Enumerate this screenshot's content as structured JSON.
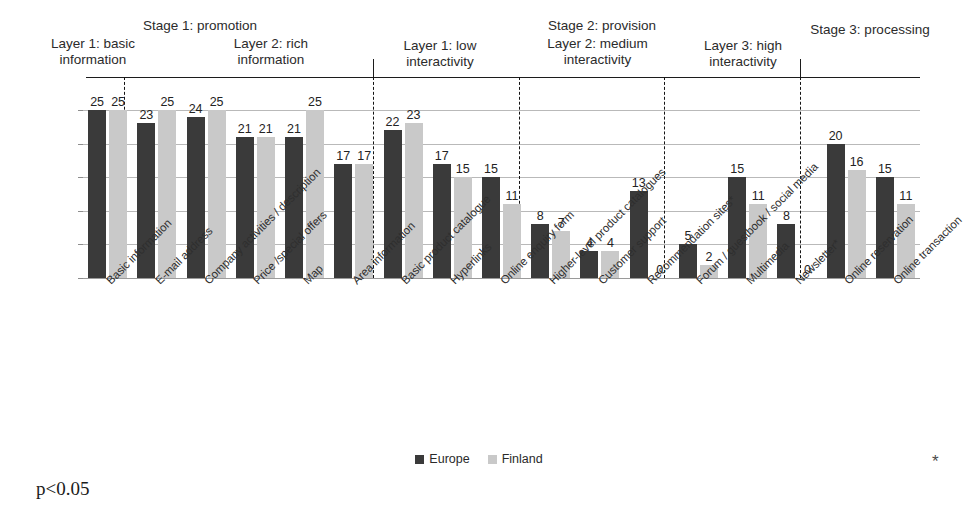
{
  "chart_data": {
    "type": "bar",
    "title": "",
    "xlabel": "",
    "ylabel": "",
    "ylim": [
      0,
      25
    ],
    "grid": true,
    "gridline_values": [
      25,
      20,
      15,
      10,
      5,
      0
    ],
    "legend_position": "bottom-center",
    "categories": [
      "Basic information",
      "E-mail address",
      "Company activities / description",
      "Price /special offers",
      "Map",
      "Area information",
      "Basic product catalogue",
      "Hyperlinks",
      "Online enquiry form",
      "Higher-level product catalogues",
      "Customer support",
      "Recommendation sites*",
      "Forum / guestbook / social media",
      "Multimedia",
      "Newsletter*",
      "Online reservation",
      "Online transaction"
    ],
    "series": [
      {
        "name": "Europe",
        "color": "#3a3a3a",
        "values": [
          25,
          23,
          24,
          21,
          21,
          17,
          22,
          17,
          15,
          8,
          4,
          13,
          5,
          15,
          8,
          20,
          15
        ]
      },
      {
        "name": "Finland",
        "color": "#c9c9c9",
        "values": [
          25,
          25,
          25,
          21,
          25,
          17,
          23,
          15,
          11,
          7,
          4,
          0,
          2,
          11,
          0,
          16,
          11
        ]
      }
    ],
    "annotations": [
      "p<0.05",
      "*"
    ]
  },
  "header": {
    "stage_labels": [
      {
        "text": "Stage 1: promotion",
        "left": 100,
        "top": 18,
        "width": 200
      },
      {
        "text": "Stage 2: provision",
        "left": 512,
        "top": 18,
        "width": 180
      },
      {
        "text": "Stage 3: processing",
        "left": 780,
        "top": 22,
        "width": 180
      }
    ],
    "layer_labels": [
      {
        "text": "Layer 1: basic\ninformation",
        "left": 28,
        "top": 36,
        "width": 130
      },
      {
        "text": "Layer 2: rich\ninformation",
        "left": 196,
        "top": 36,
        "width": 150
      },
      {
        "text": "Layer 1: low\ninteractivity",
        "left": 374,
        "top": 38,
        "width": 132
      },
      {
        "text": "Layer 2: medium\ninteractivity",
        "left": 515,
        "top": 36,
        "width": 165
      },
      {
        "text": "Layer 3: high\ninteractivity",
        "left": 673,
        "top": 38,
        "width": 140
      }
    ]
  },
  "plot": {
    "dividers_px": [
      124,
      373,
      519,
      664,
      800
    ],
    "header_rule": {
      "left": 86,
      "top": 77,
      "width": 834
    },
    "header_ticks_px": [
      373,
      800
    ]
  },
  "legend": {
    "items": [
      {
        "label": "Europe",
        "swatch": "europe"
      },
      {
        "label": "Finland",
        "swatch": "finland"
      }
    ]
  },
  "footnotes": {
    "significance": "p<0.05",
    "asterisk": "*"
  },
  "colors": {
    "europe": "#3a3a3a",
    "finland": "#c9c9c9",
    "gridline": "#b9b9b9",
    "divider": "#141414",
    "text": "#232323"
  }
}
